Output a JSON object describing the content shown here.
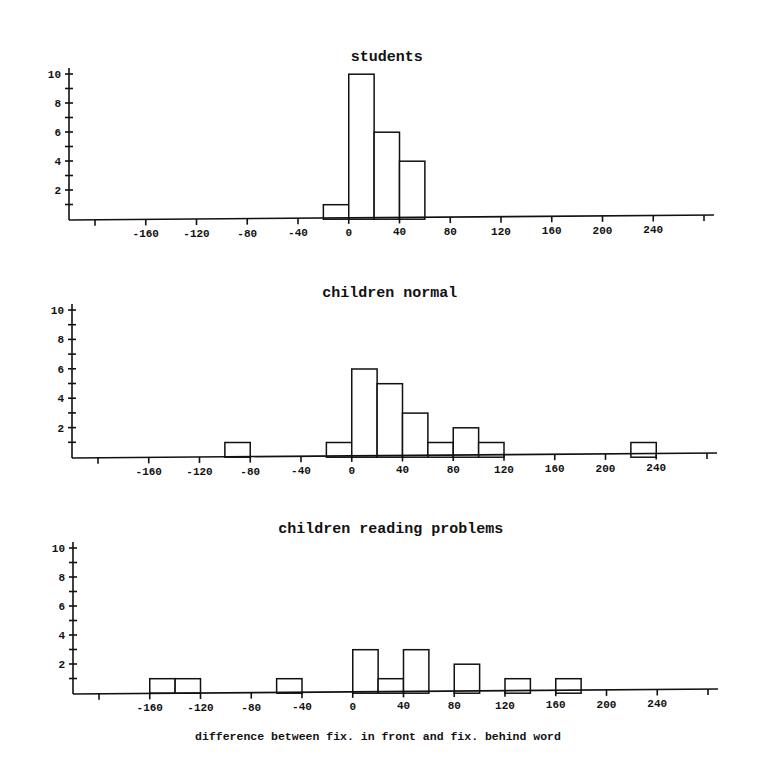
{
  "chart_data": [
    {
      "type": "bar",
      "title": "students",
      "xlabel": "",
      "ylabel": "",
      "bin_width": 20,
      "xlim": [
        -200,
        280
      ],
      "ylim": [
        0,
        10
      ],
      "x_tick_labels": [
        "-160",
        "-120",
        "-80",
        "-40",
        "0",
        "40",
        "80",
        "120",
        "160",
        "200",
        "240"
      ],
      "y_tick_labels": [
        "2",
        "4",
        "6",
        "8",
        "10"
      ],
      "bins": [
        {
          "from": -20,
          "to": 0,
          "count": 1
        },
        {
          "from": 0,
          "to": 20,
          "count": 10
        },
        {
          "from": 20,
          "to": 40,
          "count": 6
        },
        {
          "from": 40,
          "to": 60,
          "count": 4
        }
      ]
    },
    {
      "type": "bar",
      "title": "children normal",
      "xlabel": "",
      "ylabel": "",
      "bin_width": 20,
      "xlim": [
        -200,
        280
      ],
      "ylim": [
        0,
        10
      ],
      "x_tick_labels": [
        "-160",
        "-120",
        "-80",
        "-40",
        "0",
        "40",
        "80",
        "120",
        "160",
        "200",
        "240"
      ],
      "y_tick_labels": [
        "2",
        "4",
        "6",
        "8",
        "10"
      ],
      "bins": [
        {
          "from": -100,
          "to": -80,
          "count": 1
        },
        {
          "from": -20,
          "to": 0,
          "count": 1
        },
        {
          "from": 0,
          "to": 20,
          "count": 6
        },
        {
          "from": 20,
          "to": 40,
          "count": 5
        },
        {
          "from": 40,
          "to": 60,
          "count": 3
        },
        {
          "from": 60,
          "to": 80,
          "count": 1
        },
        {
          "from": 80,
          "to": 100,
          "count": 2
        },
        {
          "from": 100,
          "to": 120,
          "count": 1
        },
        {
          "from": 220,
          "to": 240,
          "count": 1
        }
      ]
    },
    {
      "type": "bar",
      "title": "children reading problems",
      "xlabel": "difference between fix. in front and fix. behind word",
      "ylabel": "",
      "bin_width": 20,
      "xlim": [
        -200,
        280
      ],
      "ylim": [
        0,
        10
      ],
      "x_tick_labels": [
        "-160",
        "-120",
        "-80",
        "-40",
        "0",
        "40",
        "80",
        "120",
        "160",
        "200",
        "240"
      ],
      "y_tick_labels": [
        "2",
        "4",
        "6",
        "8",
        "10"
      ],
      "bins": [
        {
          "from": -160,
          "to": -140,
          "count": 1
        },
        {
          "from": -140,
          "to": -120,
          "count": 1
        },
        {
          "from": -60,
          "to": -40,
          "count": 1
        },
        {
          "from": 0,
          "to": 20,
          "count": 3
        },
        {
          "from": 20,
          "to": 40,
          "count": 1
        },
        {
          "from": 40,
          "to": 60,
          "count": 3
        },
        {
          "from": 80,
          "to": 100,
          "count": 2
        },
        {
          "from": 120,
          "to": 140,
          "count": 1
        },
        {
          "from": 160,
          "to": 180,
          "count": 1
        }
      ]
    }
  ],
  "figure": {
    "xlabel": "difference between fix. in front and fix. behind word"
  }
}
